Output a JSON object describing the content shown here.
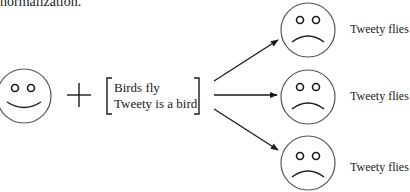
{
  "caption": "normalization.",
  "input_agent": {
    "expression": "happy",
    "icon": "smiley-face-icon"
  },
  "operator": "+",
  "premises": [
    "Birds fly",
    "Tweety is a bird"
  ],
  "outcomes": [
    {
      "expression": "sad",
      "icon": "sad-face-icon",
      "label": "Tweety flies"
    },
    {
      "expression": "sad",
      "icon": "sad-face-icon",
      "label": "Tweety flies"
    },
    {
      "expression": "sad",
      "icon": "sad-face-icon",
      "label": "Tweety flies"
    }
  ],
  "colors": {
    "stroke": "#1a1a1a",
    "face_outline": "#555555",
    "background": "#ffffff"
  }
}
